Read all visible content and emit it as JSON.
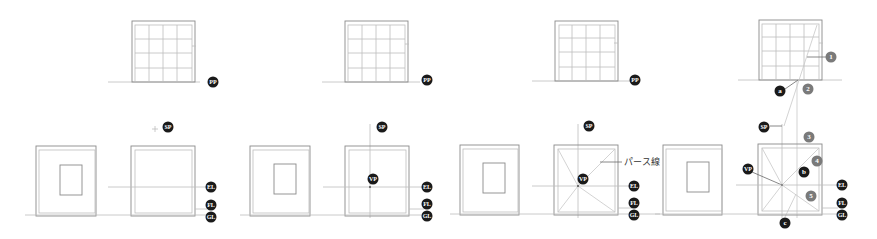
{
  "diagram": {
    "title": "",
    "colors": {
      "line": "#8a8a8a",
      "badge_dark": "#1a1a1a",
      "badge_gray": "#7a7a7a",
      "background": "#ffffff"
    },
    "labels": {
      "pp": "PP",
      "sp": "SP",
      "vp": "VP",
      "el": "EL",
      "fl": "FL",
      "gl": "GL",
      "perspective_line": "パース線",
      "a": "a",
      "b": "b",
      "c": "c",
      "n1": "1",
      "n2": "2",
      "n3": "3",
      "n4": "4",
      "n5": "5"
    },
    "panels": [
      {
        "step": 1,
        "has_vp": false,
        "has_diagonals": false,
        "has_perspective_label": false,
        "has_construction": false
      },
      {
        "step": 2,
        "has_vp": true,
        "has_diagonals": false,
        "has_perspective_label": false,
        "has_construction": false
      },
      {
        "step": 3,
        "has_vp": true,
        "has_diagonals": true,
        "has_perspective_label": true,
        "has_construction": false
      },
      {
        "step": 4,
        "has_vp": true,
        "has_diagonals": true,
        "has_perspective_label": false,
        "has_construction": true
      }
    ]
  }
}
